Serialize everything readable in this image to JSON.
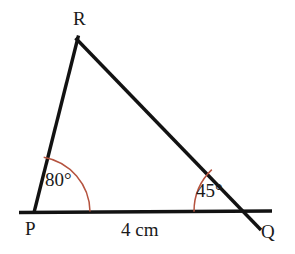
{
  "figure": {
    "type": "geometry-diagram",
    "shape": "triangle",
    "vertices": [
      {
        "name": "R",
        "label": "R",
        "x": 84,
        "y": 47
      },
      {
        "name": "P",
        "label": "P",
        "x": 34,
        "y": 212
      },
      {
        "name": "Q",
        "label": "Q",
        "x": 252,
        "y": 211
      }
    ],
    "angles": [
      {
        "at": "P",
        "label": "80°",
        "value": 80,
        "unit": "degrees",
        "arc_radius": 56
      },
      {
        "at": "Q",
        "label": "45°",
        "value": 45,
        "unit": "degrees",
        "arc_radius": 58
      }
    ],
    "sides": [
      {
        "from": "P",
        "to": "Q",
        "label": "4 cm",
        "length": 4,
        "unit": "cm"
      }
    ],
    "colors": {
      "line": "#121212",
      "arc": "#b5533f",
      "text": "#1a1a1a",
      "background": "#ffffff"
    }
  }
}
